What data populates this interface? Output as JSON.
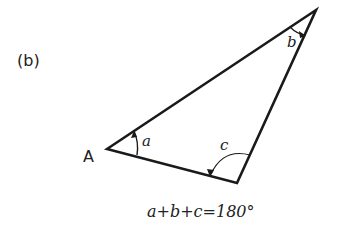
{
  "figure": {
    "label": "(b)",
    "vertex_label": "A",
    "angles": [
      {
        "name": "a",
        "vertex": "A"
      },
      {
        "name": "b",
        "vertex": "top-right"
      },
      {
        "name": "c",
        "vertex": "bottom"
      }
    ],
    "equation": "a+b+c=180°",
    "colors": {
      "stroke": "#1a1a1a",
      "text": "#222222"
    }
  }
}
